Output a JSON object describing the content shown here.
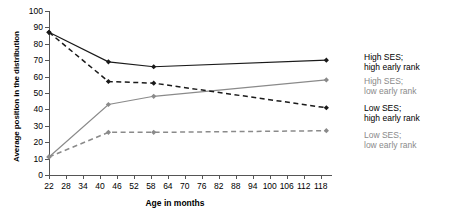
{
  "chart_data": {
    "type": "line",
    "title": "",
    "xlabel": "Age in months",
    "ylabel": "Average position in the distribution",
    "xlim": [
      22,
      122
    ],
    "ylim": [
      0,
      100
    ],
    "grid": false,
    "legend_position": "right-inline-at-line-ends",
    "xticks": [
      22,
      28,
      34,
      40,
      46,
      52,
      58,
      64,
      70,
      76,
      82,
      88,
      94,
      100,
      106,
      112,
      118
    ],
    "yticks": [
      0,
      10,
      20,
      30,
      40,
      50,
      60,
      70,
      80,
      90,
      100
    ],
    "x": [
      22,
      43,
      59,
      120
    ],
    "series": [
      {
        "name": "High SES; high early rank",
        "label_line1": "High SES;",
        "label_line2": "high early rank",
        "color": "#1a1a1a",
        "style": "solid",
        "values": [
          87,
          69,
          66,
          70
        ]
      },
      {
        "name": "High SES; low early rank",
        "label_line1": "High SES;",
        "label_line2": "low early rank",
        "color": "#8a8a8a",
        "style": "solid",
        "values": [
          11,
          43,
          48,
          58
        ]
      },
      {
        "name": "Low SES; high early rank",
        "label_line1": "Low SES;",
        "label_line2": "high early rank",
        "color": "#1a1a1a",
        "style": "dashed",
        "values": [
          87,
          57,
          56,
          41
        ]
      },
      {
        "name": "Low SES; low early rank",
        "label_line1": "Low SES;",
        "label_line2": "low early rank",
        "color": "#8a8a8a",
        "style": "dashed",
        "values": [
          11,
          26,
          26,
          27
        ]
      }
    ]
  },
  "axes": {
    "y_title": "Average position in the distribution",
    "x_title": "Age in months"
  },
  "legend": {
    "items": [
      {
        "line1": "High SES;",
        "line2": "high early rank"
      },
      {
        "line1": "High SES;",
        "line2": "low early rank"
      },
      {
        "line1": "Low SES;",
        "line2": "high early rank"
      },
      {
        "line1": "Low SES;",
        "line2": "low early rank"
      }
    ]
  }
}
